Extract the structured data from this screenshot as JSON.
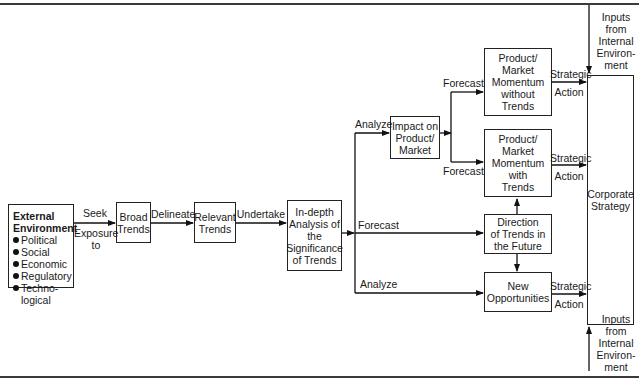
{
  "diagram": {
    "external_environment": {
      "title_line1": "External",
      "title_line2": "Environment",
      "items": [
        "Political",
        "Social",
        "Economic",
        "Regulatory",
        "Techno-"
      ],
      "last_item_continuation": "logical"
    },
    "boxes": {
      "broad_trends": "Broad\nTrends",
      "relevant_trends": "Relevant\nTrends",
      "indepth_analysis": "In-depth\nAnalysis of\nthe\nSignificance\nof Trends",
      "impact": "Impact on\nProduct/\nMarket",
      "momentum_without": "Product/\nMarket\nMomentum\nwithout\nTrends",
      "momentum_with": "Product/\nMarket\nMomentum\nwith\nTrends",
      "direction": "Direction\nof Trends in\nthe Future",
      "new_opportunities": "New\nOpportunities",
      "corporate_strategy": "Corporate\nStrategy"
    },
    "edge_labels": {
      "seek": "Seek",
      "exposure_to": "Exposure\nto",
      "delineate": "Delineate",
      "undertake": "Undertake",
      "analyze_top": "Analyze",
      "forecast_mid": "Forecast",
      "analyze_bottom": "Analyze",
      "forecast_upper": "Forecast",
      "forecast_lower": "Forecast",
      "strategic_1": "Strategic",
      "action_1": "Action",
      "strategic_2": "Strategic",
      "action_2": "Action",
      "strategic_3": "Strategic",
      "action_3": "Action",
      "inputs_top": "Inputs\nfrom\nInternal\nEnviron-\nment",
      "inputs_bottom": "Inputs\nfrom\nInternal\nEnviron-\nment"
    }
  }
}
